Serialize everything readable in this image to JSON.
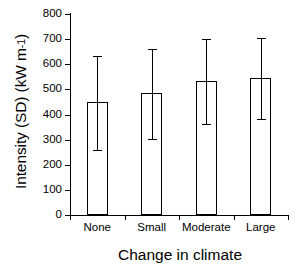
{
  "chart_data": {
    "type": "bar",
    "title": "",
    "xlabel": "Change in climate",
    "ylabel": "Intensity (SD) (kW m-1)",
    "ylabel_parts": {
      "main": "Intensity (SD) (kW m",
      "exponent": "-1",
      "tail": ")"
    },
    "categories": [
      "None",
      "Small",
      "Moderate",
      "Large"
    ],
    "values": [
      448,
      486,
      534,
      546
    ],
    "errors_upper": [
      633,
      661,
      701,
      705
    ],
    "errors_lower": [
      259,
      303,
      362,
      382
    ],
    "ylim": [
      0,
      800
    ],
    "yticks": [
      0,
      100,
      200,
      300,
      400,
      500,
      600,
      700,
      800
    ],
    "ytick_labels": [
      "0",
      "100",
      "200",
      "300",
      "400",
      "500",
      "600",
      "700",
      "800"
    ],
    "grid": false,
    "legend": "none",
    "bar_facecolor": "#ffffff",
    "bar_edgecolor": "#000000",
    "error_color": "#000000",
    "background": "#ffffff"
  }
}
